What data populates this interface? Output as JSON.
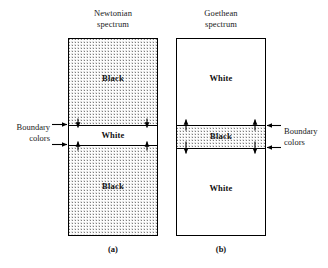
{
  "figure": {
    "panels": [
      {
        "id": "a",
        "title": "Newtonian\nspectrum",
        "caption": "(a)",
        "regions": [
          {
            "label": "Black",
            "fill": "stipple"
          },
          {
            "label": "White",
            "fill": "white"
          },
          {
            "label": "Black",
            "fill": "stipple"
          }
        ],
        "boundary_label": "Boundary\ncolors",
        "boundary_label_side": "left",
        "arrow_direction": "inward"
      },
      {
        "id": "b",
        "title": "Goethean\nspectrum",
        "caption": "(b)",
        "regions": [
          {
            "label": "White",
            "fill": "white"
          },
          {
            "label": "Black",
            "fill": "stipple"
          },
          {
            "label": "White",
            "fill": "white"
          }
        ],
        "boundary_label": "Boundary\ncolors",
        "boundary_label_side": "right",
        "arrow_direction": "outward"
      }
    ],
    "colors": {
      "line": "#000000",
      "stipple_dot": "#808080",
      "background": "#ffffff",
      "text": "#111111"
    }
  }
}
